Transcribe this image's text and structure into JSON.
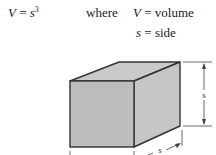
{
  "formula": {
    "lhs": "V",
    "equals": "=",
    "base": "s",
    "exponent": "3"
  },
  "where_label": "where",
  "definitions": [
    {
      "symbol": "V",
      "equals": "=",
      "meaning": "volume"
    },
    {
      "symbol": "s",
      "equals": "=",
      "meaning": "side"
    }
  ],
  "diagram": {
    "shape": "cube",
    "face_color": "#bdbdbd",
    "side_face_color": "#c6c6c6",
    "top_face_color": "#c9c9c9",
    "edge_color": "#333333",
    "dimension_labels": {
      "height": "s",
      "depth": "s"
    }
  }
}
